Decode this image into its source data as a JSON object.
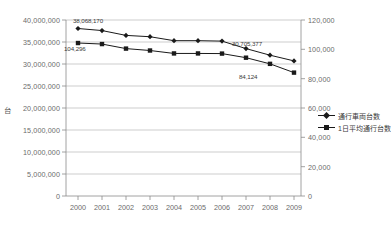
{
  "chart_data": {
    "type": "line",
    "title": "",
    "subtitle": "",
    "xlabel": "",
    "ylabel": "台",
    "y2label": "",
    "categories": [
      "2000",
      "2001",
      "2002",
      "2003",
      "2004",
      "2005",
      "2006",
      "2007",
      "2008",
      "2009"
    ],
    "ylim": [
      0,
      40000000
    ],
    "y2lim": [
      0,
      120000
    ],
    "y_ticks": [
      "0",
      "5,000,000",
      "10,000,000",
      "15,000,000",
      "20,000,000",
      "25,000,000",
      "30,000,000",
      "35,000,000",
      "40,000,000"
    ],
    "y2_ticks": [
      "0",
      "20,000",
      "40,000",
      "60,000",
      "80,000",
      "100,000",
      "120,000"
    ],
    "grid": true,
    "legend_position": "right",
    "series": [
      {
        "name": "通行車両台数",
        "axis": "left",
        "marker": "diamond",
        "color": "#1a1a1a",
        "values": [
          38068170,
          37600000,
          36500000,
          36200000,
          35300000,
          35300000,
          35200000,
          33500000,
          32000000,
          30705377
        ]
      },
      {
        "name": "1日平均通行台数",
        "axis": "right",
        "marker": "square",
        "color": "#1a1a1a",
        "values": [
          104296,
          103600,
          100500,
          99200,
          97200,
          97200,
          97100,
          94300,
          90100,
          84124
        ]
      }
    ],
    "point_labels": [
      {
        "series": "通行車両台数",
        "category": "2000",
        "text": "38,068,170"
      },
      {
        "series": "通行車両台数",
        "category": "2009",
        "text": "30,705,377"
      },
      {
        "series": "1日平均通行台数",
        "category": "2000",
        "text": "104,296"
      },
      {
        "series": "1日平均通行台数",
        "category": "2009",
        "text": "84,124"
      }
    ]
  },
  "legend": {
    "items": [
      {
        "label": "通行車両台数"
      },
      {
        "label": "1日平均通行台数"
      }
    ]
  },
  "axes": {
    "left_unit": "台"
  }
}
